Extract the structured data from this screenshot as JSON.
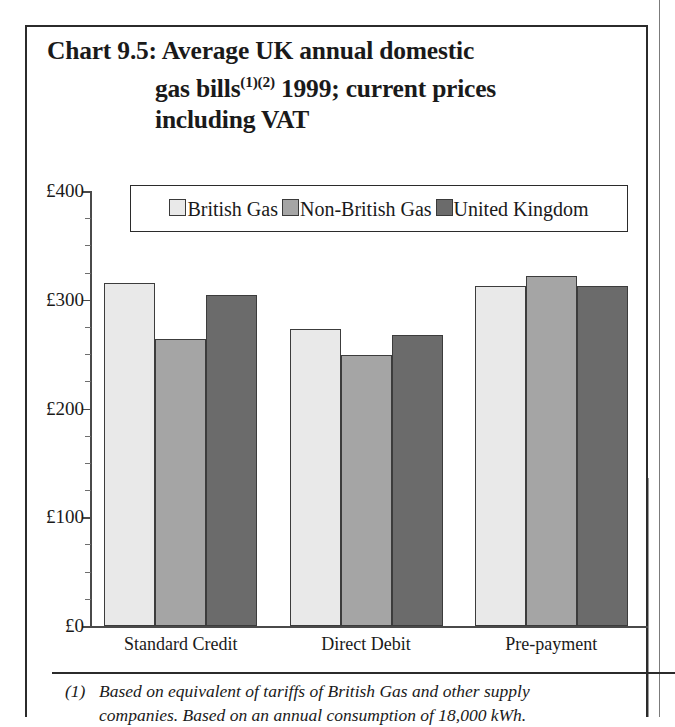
{
  "figure": {
    "title_lines": [
      "Chart 9.5: Average UK annual domestic",
      "gas bills",
      "(1)(2)",
      " 1999; current prices",
      "including VAT"
    ],
    "title_line1": "Chart 9.5: Average UK annual domestic",
    "title_line2a": "gas bills",
    "title_line2sup": "(1)(2)",
    "title_line2b": " 1999; current prices",
    "title_line3": "including VAT",
    "footnote_marker": "(1)",
    "footnote_line1": "Based on equivalent of tariffs of British Gas and other supply",
    "footnote_line2": "companies. Based on an annual consumption of 18,000 kWh."
  },
  "legend": {
    "entries": [
      {
        "label": "British Gas",
        "color": "#e9e9e9"
      },
      {
        "label": "Non-British Gas",
        "color": "#a5a5a5"
      },
      {
        "label": "United Kingdom",
        "color": "#6b6b6b"
      }
    ]
  },
  "axis": {
    "y_ticks": [
      "£0",
      "£100",
      "£200",
      "£300",
      "£400"
    ],
    "y_tick_values": [
      0,
      100,
      200,
      300,
      400
    ],
    "y_minor_step": 25,
    "x_categories": [
      "Standard Credit",
      "Direct Debit",
      "Pre-payment"
    ]
  },
  "chart_data": {
    "type": "bar",
    "title": "Chart 9.5: Average UK annual domestic gas bills(1)(2) 1999; current prices including VAT",
    "xlabel": "",
    "ylabel": "",
    "ylim": [
      0,
      400
    ],
    "ytick_labels": [
      "£0",
      "£100",
      "£200",
      "£300",
      "£400"
    ],
    "yticks": [
      0,
      100,
      200,
      300,
      400
    ],
    "y_minor_tick_step": 25,
    "currency": "£",
    "grid": false,
    "legend_position": "top-center",
    "categories": [
      "Standard Credit",
      "Direct Debit",
      "Pre-payment"
    ],
    "series": [
      {
        "name": "British Gas",
        "color": "#e9e9e9",
        "values": [
          315,
          273,
          313
        ]
      },
      {
        "name": "Non-British Gas",
        "color": "#a5a5a5",
        "values": [
          264,
          249,
          322
        ]
      },
      {
        "name": "United Kingdom",
        "color": "#6b6b6b",
        "values": [
          304,
          268,
          313
        ]
      }
    ],
    "annotations": [
      "(1) Based on equivalent of tariffs of British Gas and other supply companies. Based on an annual consumption of 18,000 kWh."
    ]
  }
}
